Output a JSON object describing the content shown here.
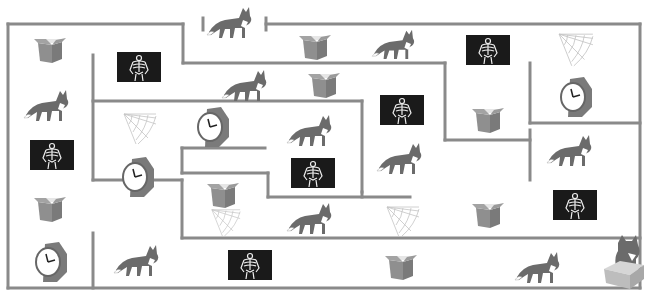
{
  "puzzle": {
    "type": "maze",
    "colors": {
      "wall": "#8a8a8a",
      "background": "#ffffff",
      "fox_body": "#6b6b6b",
      "box": "#8f8f8f",
      "xray_bg": "#1a1a1a",
      "web": "#c4c4c4",
      "watch_band": "#7a7a7a"
    },
    "walls": [
      [
        8,
        24,
        8,
        288
      ],
      [
        8,
        24,
        183,
        24
      ],
      [
        266,
        24,
        640,
        24
      ],
      [
        640,
        24,
        640,
        288
      ],
      [
        8,
        288,
        640,
        288
      ],
      [
        203,
        18,
        203,
        30
      ],
      [
        266,
        18,
        266,
        30
      ],
      [
        183,
        24,
        183,
        63
      ],
      [
        183,
        63,
        445,
        63
      ],
      [
        445,
        63,
        445,
        140
      ],
      [
        445,
        140,
        530,
        140
      ],
      [
        530,
        130,
        530,
        180
      ],
      [
        93,
        55,
        93,
        180
      ],
      [
        93,
        101,
        362,
        101
      ],
      [
        362,
        101,
        362,
        192
      ],
      [
        182,
        148,
        265,
        148
      ],
      [
        182,
        148,
        182,
        173
      ],
      [
        182,
        173,
        268,
        173
      ],
      [
        268,
        173,
        268,
        197
      ],
      [
        268,
        197,
        410,
        197
      ],
      [
        93,
        180,
        182,
        180
      ],
      [
        182,
        180,
        182,
        238
      ],
      [
        182,
        238,
        640,
        238
      ],
      [
        93,
        233,
        93,
        288
      ],
      [
        530,
        63,
        530,
        123
      ],
      [
        530,
        123,
        640,
        123
      ],
      [
        362,
        192,
        362,
        197
      ]
    ],
    "items": [
      {
        "kind": "fox",
        "x": 205,
        "y": 2,
        "w": 50,
        "h": 38,
        "name": "fox-entrance"
      },
      {
        "kind": "box",
        "x": 32,
        "y": 33,
        "w": 36,
        "h": 32
      },
      {
        "kind": "xray",
        "x": 117,
        "y": 52,
        "w": 44,
        "h": 30
      },
      {
        "kind": "box",
        "x": 297,
        "y": 30,
        "w": 36,
        "h": 32
      },
      {
        "kind": "fox",
        "x": 370,
        "y": 25,
        "w": 48,
        "h": 36
      },
      {
        "kind": "xray",
        "x": 466,
        "y": 35,
        "w": 44,
        "h": 30
      },
      {
        "kind": "web",
        "x": 557,
        "y": 32,
        "w": 38,
        "h": 36
      },
      {
        "kind": "fox",
        "x": 22,
        "y": 85,
        "w": 50,
        "h": 38
      },
      {
        "kind": "fox",
        "x": 220,
        "y": 65,
        "w": 50,
        "h": 38
      },
      {
        "kind": "box",
        "x": 306,
        "y": 68,
        "w": 36,
        "h": 32
      },
      {
        "kind": "xray",
        "x": 380,
        "y": 95,
        "w": 44,
        "h": 30
      },
      {
        "kind": "clock",
        "x": 558,
        "y": 75,
        "w": 36,
        "h": 44
      },
      {
        "kind": "web",
        "x": 122,
        "y": 112,
        "w": 36,
        "h": 34
      },
      {
        "kind": "clock",
        "x": 195,
        "y": 105,
        "w": 36,
        "h": 44
      },
      {
        "kind": "fox",
        "x": 285,
        "y": 110,
        "w": 50,
        "h": 38
      },
      {
        "kind": "box",
        "x": 470,
        "y": 103,
        "w": 36,
        "h": 32
      },
      {
        "kind": "xray",
        "x": 30,
        "y": 140,
        "w": 44,
        "h": 30
      },
      {
        "kind": "fox",
        "x": 375,
        "y": 138,
        "w": 50,
        "h": 38
      },
      {
        "kind": "fox",
        "x": 545,
        "y": 130,
        "w": 50,
        "h": 38
      },
      {
        "kind": "clock",
        "x": 120,
        "y": 155,
        "w": 36,
        "h": 44
      },
      {
        "kind": "xray",
        "x": 291,
        "y": 158,
        "w": 44,
        "h": 30
      },
      {
        "kind": "box",
        "x": 205,
        "y": 178,
        "w": 36,
        "h": 32
      },
      {
        "kind": "box",
        "x": 32,
        "y": 192,
        "w": 36,
        "h": 32
      },
      {
        "kind": "web",
        "x": 208,
        "y": 208,
        "w": 36,
        "h": 30
      },
      {
        "kind": "fox",
        "x": 285,
        "y": 198,
        "w": 50,
        "h": 38
      },
      {
        "kind": "web",
        "x": 385,
        "y": 205,
        "w": 36,
        "h": 34
      },
      {
        "kind": "box",
        "x": 470,
        "y": 198,
        "w": 36,
        "h": 32
      },
      {
        "kind": "xray",
        "x": 553,
        "y": 190,
        "w": 44,
        "h": 30
      },
      {
        "kind": "clock",
        "x": 33,
        "y": 240,
        "w": 36,
        "h": 44
      },
      {
        "kind": "fox",
        "x": 112,
        "y": 240,
        "w": 50,
        "h": 38
      },
      {
        "kind": "xray",
        "x": 228,
        "y": 250,
        "w": 44,
        "h": 30
      },
      {
        "kind": "box",
        "x": 383,
        "y": 250,
        "w": 36,
        "h": 32
      },
      {
        "kind": "fox",
        "x": 513,
        "y": 247,
        "w": 50,
        "h": 38
      },
      {
        "kind": "fox-in-box",
        "x": 600,
        "y": 233,
        "w": 48,
        "h": 58,
        "name": "goal-fox-in-box"
      }
    ]
  }
}
